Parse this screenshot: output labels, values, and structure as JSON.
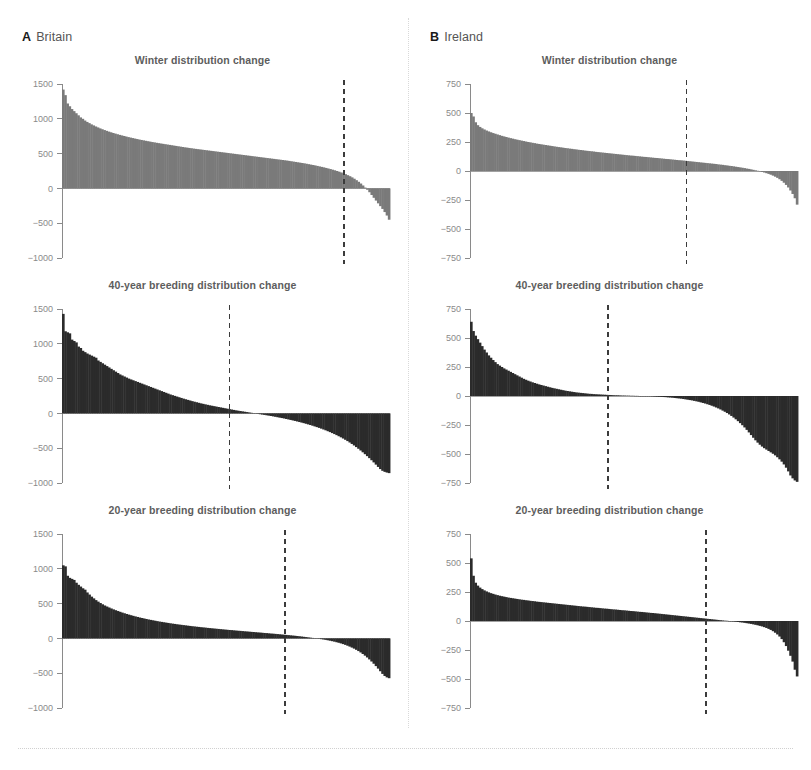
{
  "figure": {
    "divider_color": "#d9d9d9",
    "background": "#ffffff"
  },
  "panels": [
    {
      "letter": "A",
      "region": "Britain",
      "charts": [
        {
          "title": "Winter distribution change",
          "series_color": "#7a7a7a",
          "ylim": [
            -1000,
            1500
          ],
          "yticks": [
            1500,
            1000,
            500,
            0,
            -500,
            -1000
          ],
          "ytick_labels": [
            "1500",
            "1000",
            "500",
            "0",
            "−500",
            "−1000"
          ],
          "crossing_fraction": 0.86,
          "max_value": 1420,
          "min_value": -450
        },
        {
          "title": "40-year breeding distribution change",
          "series_color": "#2b2b2b",
          "ylim": [
            -1000,
            1500
          ],
          "yticks": [
            1500,
            1000,
            500,
            0,
            -500,
            -1000
          ],
          "ytick_labels": [
            "1500",
            "1000",
            "500",
            "0",
            "−500",
            "−1000"
          ],
          "crossing_fraction": 0.51,
          "max_value": 1430,
          "min_value": -860
        },
        {
          "title": "20-year breeding distribution change",
          "series_color": "#2b2b2b",
          "ylim": [
            -1000,
            1500
          ],
          "yticks": [
            1500,
            1000,
            500,
            0,
            -500,
            -1000
          ],
          "ytick_labels": [
            "1500",
            "1000",
            "500",
            "0",
            "−500",
            "−1000"
          ],
          "crossing_fraction": 0.68,
          "max_value": 1050,
          "min_value": -575
        }
      ]
    },
    {
      "letter": "B",
      "region": "Ireland",
      "charts": [
        {
          "title": "Winter distribution change",
          "series_color": "#7a7a7a",
          "ylim": [
            -750,
            750
          ],
          "yticks": [
            750,
            500,
            250,
            0,
            -250,
            -500,
            -750
          ],
          "ytick_labels": [
            "750",
            "500",
            "250",
            "0",
            "−250",
            "−500",
            "−750"
          ],
          "crossing_fraction": 0.66,
          "max_value": 500,
          "min_value": -290
        },
        {
          "title": "40-year breeding distribution change",
          "series_color": "#2b2b2b",
          "ylim": [
            -750,
            750
          ],
          "yticks": [
            750,
            500,
            250,
            0,
            -250,
            -500,
            -750
          ],
          "ytick_labels": [
            "750",
            "500",
            "250",
            "0",
            "−250",
            "−500",
            "−750"
          ],
          "crossing_fraction": 0.42,
          "max_value": 640,
          "min_value": -740
        },
        {
          "title": "20-year breeding distribution change",
          "series_color": "#2b2b2b",
          "ylim": [
            -750,
            750
          ],
          "yticks": [
            750,
            500,
            250,
            0,
            -250,
            -500,
            -750
          ],
          "ytick_labels": [
            "750",
            "500",
            "250",
            "0",
            "−250",
            "−500",
            "−750"
          ],
          "crossing_fraction": 0.72,
          "max_value": 540,
          "min_value": -480
        }
      ]
    }
  ],
  "chart_data": [
    {
      "id": "britain-winter",
      "type": "bar",
      "title": "Winter distribution change",
      "panel": "A Britain",
      "xlabel": "",
      "ylabel": "",
      "ylim": [
        -1000,
        1500
      ],
      "yticks": [
        1500,
        1000,
        500,
        0,
        -500,
        -1000
      ],
      "grid": false,
      "legend": "none",
      "n_bars": 150,
      "sorted_descending": true,
      "color": "#7a7a7a",
      "annotations": [
        "dashed vertical line at zero-crossing, ~86% across"
      ],
      "values": [
        1420,
        1340,
        1220,
        1180,
        1140,
        1110,
        1080,
        1050,
        1020,
        1000,
        975,
        955,
        938,
        920,
        905,
        890,
        876,
        862,
        850,
        838,
        827,
        816,
        806,
        796,
        787,
        778,
        769,
        761,
        753,
        745,
        737,
        730,
        723,
        716,
        709,
        702,
        696,
        690,
        684,
        678,
        672,
        666,
        661,
        655,
        650,
        645,
        640,
        635,
        630,
        625,
        620,
        615,
        610,
        605,
        600,
        595,
        590,
        586,
        581,
        577,
        572,
        568,
        564,
        560,
        556,
        552,
        548,
        544,
        540,
        536,
        532,
        528,
        524,
        520,
        516,
        512,
        508,
        504,
        500,
        496,
        492,
        488,
        484,
        480,
        476,
        472,
        468,
        464,
        460,
        456,
        452,
        448,
        444,
        440,
        436,
        432,
        428,
        424,
        420,
        416,
        412,
        408,
        404,
        400,
        395,
        390,
        385,
        380,
        375,
        370,
        365,
        360,
        354,
        348,
        342,
        336,
        330,
        323,
        316,
        309,
        302,
        294,
        286,
        278,
        269,
        260,
        250,
        240,
        229,
        217,
        204,
        190,
        175,
        158,
        139,
        118,
        95,
        70,
        42,
        12,
        -20,
        -55,
        -95,
        -135,
        -175,
        -215,
        -255,
        -295,
        -340,
        -390,
        -450
      ]
    },
    {
      "id": "britain-40yr-breeding",
      "type": "bar",
      "title": "40-year breeding distribution change",
      "panel": "A Britain",
      "xlabel": "",
      "ylabel": "",
      "ylim": [
        -1000,
        1500
      ],
      "yticks": [
        1500,
        1000,
        500,
        0,
        -500,
        -1000
      ],
      "grid": false,
      "legend": "none",
      "n_bars": 150,
      "sorted_descending": true,
      "color": "#2b2b2b",
      "annotations": [
        "dashed vertical line at zero-crossing, ~51% across"
      ],
      "values": [
        1430,
        1180,
        1165,
        1150,
        1060,
        1040,
        1020,
        960,
        940,
        900,
        880,
        860,
        845,
        830,
        815,
        800,
        760,
        740,
        720,
        700,
        680,
        660,
        640,
        620,
        600,
        580,
        560,
        545,
        530,
        515,
        500,
        488,
        476,
        464,
        452,
        440,
        428,
        416,
        404,
        392,
        380,
        368,
        356,
        344,
        332,
        320,
        308,
        296,
        284,
        272,
        262,
        252,
        242,
        232,
        222,
        212,
        203,
        194,
        185,
        176,
        168,
        160,
        152,
        144,
        137,
        130,
        123,
        116,
        110,
        104,
        98,
        92,
        86,
        80,
        74,
        68,
        62,
        56,
        50,
        44,
        39,
        34,
        29,
        24,
        19,
        14,
        9,
        4,
        -2,
        -7,
        -12,
        -17,
        -22,
        -27,
        -32,
        -37,
        -43,
        -49,
        -55,
        -61,
        -67,
        -73,
        -80,
        -87,
        -94,
        -101,
        -108,
        -116,
        -124,
        -132,
        -140,
        -149,
        -158,
        -167,
        -177,
        -187,
        -197,
        -208,
        -219,
        -231,
        -243,
        -256,
        -269,
        -283,
        -297,
        -312,
        -328,
        -344,
        -361,
        -379,
        -398,
        -418,
        -439,
        -461,
        -484,
        -508,
        -533,
        -559,
        -586,
        -614,
        -643,
        -673,
        -704,
        -736,
        -769,
        -800,
        -825,
        -840,
        -850,
        -858
      ]
    },
    {
      "id": "britain-20yr-breeding",
      "type": "bar",
      "title": "20-year breeding distribution change",
      "panel": "A Britain",
      "xlabel": "",
      "ylabel": "",
      "ylim": [
        -1000,
        1500
      ],
      "yticks": [
        1500,
        1000,
        500,
        0,
        -500,
        -1000
      ],
      "grid": false,
      "legend": "none",
      "n_bars": 150,
      "sorted_descending": true,
      "color": "#2b2b2b",
      "annotations": [
        "dashed vertical line at zero-crossing, ~68% across"
      ],
      "values": [
        1050,
        1035,
        900,
        870,
        855,
        840,
        800,
        770,
        745,
        720,
        700,
        660,
        630,
        600,
        575,
        550,
        528,
        508,
        490,
        473,
        458,
        444,
        430,
        417,
        405,
        393,
        382,
        371,
        361,
        351,
        342,
        333,
        324,
        316,
        308,
        300,
        293,
        286,
        279,
        272,
        266,
        260,
        254,
        248,
        242,
        237,
        232,
        227,
        222,
        217,
        212,
        208,
        203,
        199,
        195,
        191,
        187,
        183,
        179,
        175,
        172,
        168,
        165,
        161,
        158,
        155,
        151,
        148,
        145,
        142,
        139,
        136,
        133,
        130,
        127,
        124,
        121,
        119,
        116,
        113,
        110,
        108,
        105,
        102,
        100,
        97,
        94,
        92,
        89,
        86,
        84,
        81,
        78,
        76,
        73,
        70,
        68,
        65,
        62,
        59,
        56,
        53,
        50,
        47,
        44,
        41,
        38,
        34,
        31,
        27,
        23,
        19,
        15,
        11,
        7,
        3,
        -2,
        -6,
        -11,
        -16,
        -21,
        -27,
        -33,
        -40,
        -47,
        -55,
        -63,
        -72,
        -82,
        -93,
        -105,
        -118,
        -132,
        -147,
        -164,
        -182,
        -202,
        -224,
        -248,
        -274,
        -302,
        -332,
        -364,
        -398,
        -434,
        -472,
        -510,
        -540,
        -560,
        -572
      ]
    },
    {
      "id": "ireland-winter",
      "type": "bar",
      "title": "Winter distribution change",
      "panel": "B Ireland",
      "xlabel": "",
      "ylabel": "",
      "ylim": [
        -750,
        750
      ],
      "yticks": [
        750,
        500,
        250,
        0,
        -250,
        -500,
        -750
      ],
      "grid": false,
      "legend": "none",
      "n_bars": 150,
      "sorted_descending": true,
      "color": "#7a7a7a",
      "annotations": [
        "dashed vertical line at zero-crossing, ~66% across"
      ],
      "values": [
        500,
        470,
        420,
        395,
        380,
        368,
        358,
        349,
        341,
        334,
        327,
        321,
        315,
        309,
        303,
        298,
        293,
        288,
        283,
        279,
        274,
        270,
        266,
        262,
        258,
        254,
        250,
        247,
        243,
        240,
        236,
        233,
        230,
        227,
        224,
        221,
        218,
        215,
        212,
        209,
        206,
        204,
        201,
        198,
        196,
        193,
        191,
        188,
        186,
        183,
        181,
        179,
        176,
        174,
        172,
        170,
        168,
        165,
        163,
        161,
        159,
        157,
        155,
        153,
        151,
        149,
        147,
        145,
        143,
        141,
        139,
        137,
        135,
        133,
        132,
        130,
        128,
        126,
        124,
        122,
        121,
        119,
        117,
        115,
        113,
        112,
        110,
        108,
        106,
        104,
        103,
        101,
        99,
        97,
        95,
        93,
        92,
        90,
        88,
        86,
        84,
        82,
        80,
        78,
        76,
        74,
        72,
        70,
        68,
        66,
        64,
        62,
        60,
        57,
        55,
        53,
        50,
        48,
        45,
        43,
        40,
        37,
        34,
        31,
        28,
        25,
        21,
        18,
        14,
        10,
        6,
        2,
        -3,
        -8,
        -13,
        -19,
        -25,
        -32,
        -40,
        -49,
        -59,
        -71,
        -85,
        -101,
        -120,
        -142,
        -168,
        -198,
        -235,
        -290
      ]
    },
    {
      "id": "ireland-40yr-breeding",
      "type": "bar",
      "title": "40-year breeding distribution change",
      "panel": "B Ireland",
      "xlabel": "",
      "ylabel": "",
      "ylim": [
        -750,
        750
      ],
      "yticks": [
        750,
        500,
        250,
        0,
        -250,
        -500,
        -750
      ],
      "grid": false,
      "legend": "none",
      "n_bars": 150,
      "sorted_descending": true,
      "color": "#2b2b2b",
      "annotations": [
        "dashed vertical line at zero-crossing, ~42% across"
      ],
      "values": [
        640,
        560,
        520,
        490,
        460,
        430,
        400,
        375,
        350,
        330,
        310,
        292,
        275,
        262,
        250,
        238,
        228,
        218,
        208,
        198,
        188,
        178,
        168,
        158,
        148,
        140,
        132,
        125,
        118,
        112,
        106,
        100,
        95,
        90,
        85,
        80,
        75,
        70,
        66,
        62,
        58,
        54,
        50,
        46,
        43,
        40,
        37,
        34,
        31,
        29,
        27,
        25,
        23,
        21,
        19,
        18,
        16,
        15,
        14,
        13,
        12,
        11,
        10,
        9,
        8,
        7,
        6,
        6,
        5,
        4,
        4,
        3,
        3,
        2,
        2,
        1,
        1,
        0,
        -1,
        -1,
        -2,
        -2,
        -3,
        -4,
        -5,
        -6,
        -7,
        -8,
        -9,
        -10,
        -12,
        -13,
        -15,
        -17,
        -19,
        -21,
        -23,
        -26,
        -29,
        -32,
        -35,
        -38,
        -42,
        -46,
        -50,
        -55,
        -60,
        -65,
        -71,
        -77,
        -84,
        -91,
        -99,
        -107,
        -116,
        -126,
        -136,
        -147,
        -159,
        -172,
        -186,
        -201,
        -217,
        -234,
        -252,
        -271,
        -292,
        -314,
        -337,
        -360,
        -382,
        -402,
        -420,
        -436,
        -450,
        -462,
        -474,
        -486,
        -498,
        -512,
        -528,
        -546,
        -566,
        -590,
        -618,
        -650,
        -685,
        -710,
        -728,
        -740
      ]
    },
    {
      "id": "ireland-20yr-breeding",
      "type": "bar",
      "title": "20-year breeding distribution change",
      "panel": "B Ireland",
      "xlabel": "",
      "ylabel": "",
      "ylim": [
        -750,
        750
      ],
      "yticks": [
        750,
        500,
        250,
        0,
        -250,
        -500,
        -750
      ],
      "grid": false,
      "legend": "none",
      "n_bars": 150,
      "sorted_descending": true,
      "color": "#2b2b2b",
      "annotations": [
        "dashed vertical line at zero-crossing, ~72% across"
      ],
      "values": [
        540,
        390,
        330,
        305,
        288,
        275,
        264,
        255,
        247,
        240,
        234,
        228,
        223,
        218,
        214,
        210,
        206,
        202,
        199,
        196,
        193,
        190,
        187,
        184,
        182,
        179,
        177,
        174,
        172,
        170,
        167,
        165,
        163,
        161,
        159,
        157,
        155,
        153,
        151,
        149,
        147,
        145,
        143,
        141,
        139,
        137,
        135,
        133,
        131,
        129,
        127,
        125,
        124,
        122,
        120,
        118,
        116,
        114,
        113,
        111,
        109,
        107,
        106,
        104,
        102,
        100,
        99,
        97,
        95,
        93,
        92,
        90,
        88,
        86,
        85,
        83,
        81,
        79,
        78,
        76,
        74,
        72,
        70,
        69,
        67,
        65,
        63,
        61,
        59,
        57,
        55,
        53,
        51,
        49,
        47,
        45,
        43,
        41,
        39,
        37,
        35,
        33,
        31,
        29,
        27,
        25,
        23,
        21,
        19,
        17,
        15,
        13,
        11,
        9,
        7,
        5,
        3,
        2,
        0,
        -2,
        -4,
        -6,
        -8,
        -11,
        -13,
        -16,
        -19,
        -22,
        -25,
        -29,
        -33,
        -37,
        -42,
        -47,
        -53,
        -60,
        -68,
        -77,
        -88,
        -101,
        -116,
        -134,
        -156,
        -183,
        -216,
        -256,
        -300,
        -350,
        -420,
        -478
      ]
    }
  ]
}
